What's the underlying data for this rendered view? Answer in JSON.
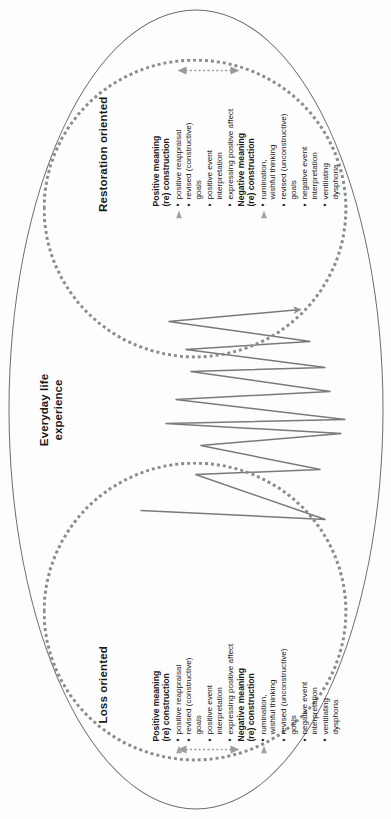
{
  "figure": {
    "everyday_label": "Everyday life\nexperience",
    "colors": {
      "outer_ellipse_stroke": "#6d6d6d",
      "inner_ellipse_stroke": "#8c8c8c",
      "zigzag_stroke": "#7a7a7a",
      "arrow_grey": "#9a9a9a",
      "text": "#1a1a1a",
      "background": "#fdfdfd"
    }
  },
  "loss": {
    "label": "Loss oriented",
    "positive": {
      "heading": "Positive meaning\n(re) construction",
      "items": [
        "positive reappraisal",
        "revised (constructive)\ngoals",
        "positive event\ninterpretation",
        "expressing positive affect"
      ]
    },
    "negative": {
      "heading": "Negative meaning\n(re) construction",
      "items": [
        "rumination,\nwishful thinking",
        "revised (unconstructive)\ngoals",
        "negative event\ninterpretation",
        "ventilating\ndysphoria"
      ]
    }
  },
  "restoration": {
    "label": "Restoration oriented",
    "positive": {
      "heading": "Positive meaning\n(re) construction",
      "items": [
        "positive reappraisal",
        "revised (constructive)\ngoals",
        "positive event\ninterpretation",
        "expressing positive affect"
      ]
    },
    "negative": {
      "heading": "Negative meaning\n(re) construction",
      "items": [
        "rumination,\nwishful thinking",
        "revised (unconstructive)\ngoals",
        "negative event\ninterpretation",
        "ventilating\ndysphoria"
      ]
    }
  }
}
